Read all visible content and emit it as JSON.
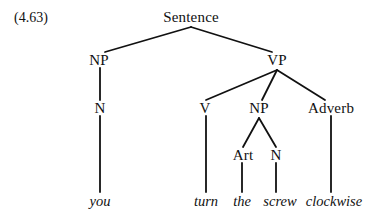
{
  "figure": {
    "reference_number": "(4.63)",
    "type": "syntax-parse-tree",
    "sentence": "you turn the screw clockwise",
    "ink_color": "#111111",
    "background_color": "#ffffff"
  },
  "tree": {
    "root": {
      "label": "Sentence",
      "x": 191,
      "y": 17
    },
    "nodes": [
      {
        "id": "np-subject",
        "label": "NP",
        "x": 99,
        "y": 60
      },
      {
        "id": "vp",
        "label": "VP",
        "x": 277,
        "y": 60
      },
      {
        "id": "n-subject",
        "label": "N",
        "x": 100,
        "y": 108
      },
      {
        "id": "v",
        "label": "V",
        "x": 205,
        "y": 108
      },
      {
        "id": "np-object",
        "label": "NP",
        "x": 259,
        "y": 108
      },
      {
        "id": "adverb",
        "label": "Adverb",
        "x": 331,
        "y": 108
      },
      {
        "id": "art",
        "label": "Art",
        "x": 243,
        "y": 155
      },
      {
        "id": "n-object",
        "label": "N",
        "x": 276,
        "y": 155
      }
    ],
    "leaves": [
      {
        "id": "leaf-you",
        "label": "you",
        "x": 100,
        "y": 201
      },
      {
        "id": "leaf-turn",
        "label": "turn",
        "x": 206,
        "y": 201
      },
      {
        "id": "leaf-the",
        "label": "the",
        "x": 242,
        "y": 201
      },
      {
        "id": "leaf-screw",
        "label": "screw",
        "x": 280,
        "y": 201
      },
      {
        "id": "leaf-clockwise",
        "label": "clockwise",
        "x": 334,
        "y": 201
      }
    ],
    "edges": [
      {
        "id": "edge-sentence-np",
        "from": "Sentence",
        "to": "NP",
        "x1": 191,
        "y1": 27,
        "x2": 105,
        "y2": 52
      },
      {
        "id": "edge-sentence-vp",
        "from": "Sentence",
        "to": "VP",
        "x1": 191,
        "y1": 27,
        "x2": 272,
        "y2": 52
      },
      {
        "id": "edge-np-n",
        "from": "NP",
        "to": "N",
        "x1": 100,
        "y1": 68,
        "x2": 100,
        "y2": 100
      },
      {
        "id": "edge-n-you",
        "from": "N",
        "to": "you",
        "x1": 100,
        "y1": 116,
        "x2": 100,
        "y2": 192
      },
      {
        "id": "edge-vp-v",
        "from": "VP",
        "to": "V",
        "x1": 277,
        "y1": 70,
        "x2": 206,
        "y2": 100
      },
      {
        "id": "edge-vp-np",
        "from": "VP",
        "to": "NP",
        "x1": 277,
        "y1": 70,
        "x2": 262,
        "y2": 100
      },
      {
        "id": "edge-vp-adverb",
        "from": "VP",
        "to": "Adverb",
        "x1": 277,
        "y1": 70,
        "x2": 325,
        "y2": 100
      },
      {
        "id": "edge-v-turn",
        "from": "V",
        "to": "turn",
        "x1": 206,
        "y1": 116,
        "x2": 206,
        "y2": 192
      },
      {
        "id": "edge-np-art",
        "from": "NP",
        "to": "Art",
        "x1": 259,
        "y1": 118,
        "x2": 243,
        "y2": 147
      },
      {
        "id": "edge-np-n2",
        "from": "NP",
        "to": "N",
        "x1": 259,
        "y1": 118,
        "x2": 276,
        "y2": 147
      },
      {
        "id": "edge-art-the",
        "from": "Art",
        "to": "the",
        "x1": 242,
        "y1": 163,
        "x2": 242,
        "y2": 192
      },
      {
        "id": "edge-n2-screw",
        "from": "N",
        "to": "screw",
        "x1": 276,
        "y1": 163,
        "x2": 276,
        "y2": 192
      },
      {
        "id": "edge-adverb-clockwise",
        "from": "Adverb",
        "to": "clockwise",
        "x1": 331,
        "y1": 116,
        "x2": 331,
        "y2": 192
      }
    ]
  }
}
